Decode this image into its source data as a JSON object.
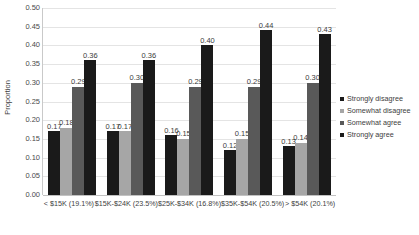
{
  "chart_data": {
    "type": "bar",
    "title": "",
    "xlabel": "",
    "ylabel": "Proportion",
    "ylim": [
      0,
      0.5
    ],
    "ytick_step": 0.05,
    "ytick_labels": [
      "0.00",
      "0.05",
      "0.10",
      "0.15",
      "0.20",
      "0.25",
      "0.30",
      "0.35",
      "0.40",
      "0.45",
      "0.50"
    ],
    "grid": true,
    "legend_position": "right",
    "categories": [
      "< $15K (19.1%)",
      "$15K-$24K (23.5%)",
      "$25K-$34K (16.8%)",
      "$35K-$54K (20.5%)",
      "> $54K (20.1%)"
    ],
    "series": [
      {
        "name": "Strongly disagree",
        "color": "#1a1a1a",
        "values": [
          0.17,
          0.17,
          0.16,
          0.12,
          0.13
        ],
        "labels": [
          "0.17",
          "0.17",
          "0.16",
          "0.12",
          "0.13"
        ]
      },
      {
        "name": "Somewhat disagree",
        "color": "#a6a6a6",
        "values": [
          0.18,
          0.17,
          0.15,
          0.15,
          0.14
        ],
        "labels": [
          "0.18",
          "0.17",
          "0.15",
          "0.15",
          "0.14"
        ]
      },
      {
        "name": "Somewhat agree",
        "color": "#595959",
        "values": [
          0.29,
          0.3,
          0.29,
          0.29,
          0.3
        ],
        "labels": [
          "0.29",
          "0.30",
          "0.29",
          "0.29",
          "0.30"
        ]
      },
      {
        "name": "Strongly agree",
        "color": "#1a1a1a",
        "values": [
          0.36,
          0.36,
          0.4,
          0.44,
          0.43
        ],
        "labels": [
          "0.36",
          "0.36",
          "0.40",
          "0.44",
          "0.43"
        ]
      }
    ]
  }
}
